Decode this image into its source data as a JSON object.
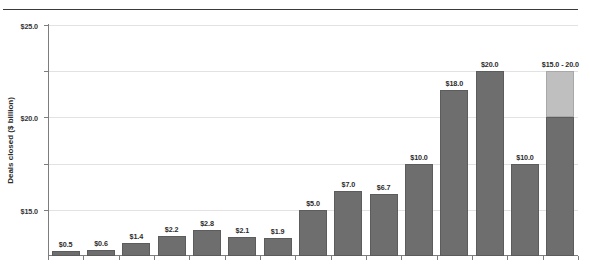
{
  "chart_data": {
    "type": "bar",
    "title": "",
    "subtitle": "",
    "xlabel": "",
    "ylabel": "Deals closed ($ billion)",
    "categories": [
      "1996",
      "1997",
      "1998",
      "1999",
      "2000",
      "2001",
      "2002",
      "2003",
      "2004",
      "2005",
      "2006",
      "2007",
      "2008",
      "2009",
      "2010E"
    ],
    "values": [
      0.5,
      0.6,
      1.4,
      2.2,
      2.8,
      2.1,
      1.9,
      5.0,
      7.0,
      6.7,
      10.0,
      18.0,
      20.0,
      10.0,
      20.0
    ],
    "data_labels": [
      "$0.5",
      "$0.6",
      "$1.4",
      "$2.2",
      "$2.8",
      "$2.1",
      "$1.9",
      "$5.0",
      "$7.0",
      "$6.7",
      "$10.0",
      "$18.0",
      "$20.0",
      "$10.0",
      "$15.0 - 20.0"
    ],
    "range_bar": {
      "category": "2010E",
      "low": 15.0,
      "high": 20.0,
      "label": "$15.0 - 20.0"
    },
    "ylim": [
      0,
      25
    ],
    "ytick_values": [
      5,
      10,
      15,
      20,
      25
    ],
    "ytick_labels": [
      "$5.0",
      "$10.0",
      "$15.0",
      "$20.0",
      "$25.0"
    ],
    "grid": true,
    "legend": "none",
    "series": [
      {
        "name": "Deals closed",
        "color": "#6e6e6e",
        "values": [
          0.5,
          0.6,
          1.4,
          2.2,
          2.8,
          2.1,
          1.9,
          5.0,
          7.0,
          6.7,
          10.0,
          18.0,
          20.0,
          10.0,
          15.0
        ]
      },
      {
        "name": "2010 estimate range (upper)",
        "color": "#bfbfbf",
        "values": [
          0,
          0,
          0,
          0,
          0,
          0,
          0,
          0,
          0,
          0,
          0,
          0,
          0,
          0,
          5.0
        ]
      }
    ]
  },
  "colors": {
    "bar_dark": "#6e6e6e",
    "bar_light": "#bfbfbf",
    "gridline": "#e2e2e2",
    "axis": "#7d7d7d",
    "rule": "#3a3a3a",
    "text": "#2b2b2b",
    "background": "#ffffff"
  }
}
